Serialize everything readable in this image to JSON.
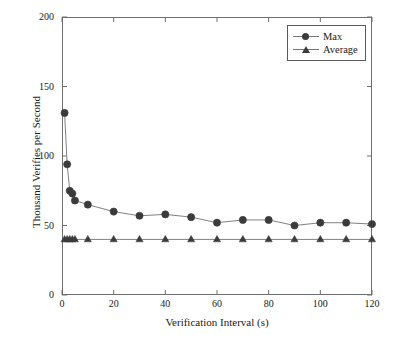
{
  "chart_data": {
    "type": "line",
    "title": "",
    "xlabel": "Verification Interval (s)",
    "ylabel": "Thousand Verifies per Second",
    "xlim": [
      0,
      120
    ],
    "ylim": [
      0,
      200
    ],
    "xticks": [
      "0",
      "20",
      "40",
      "60",
      "80",
      "100",
      "120"
    ],
    "xtick_values": [
      0,
      20,
      40,
      60,
      80,
      100,
      120
    ],
    "yticks": [
      "0",
      "50",
      "100",
      "150",
      "200"
    ],
    "ytick_values": [
      0,
      50,
      100,
      150,
      200
    ],
    "grid": false,
    "legend_position": "top-right",
    "series": [
      {
        "name": "Max",
        "marker": "circle",
        "color": "#3b3b3b",
        "x": [
          1,
          2,
          3,
          4,
          5,
          10,
          20,
          30,
          40,
          50,
          60,
          70,
          80,
          90,
          100,
          110,
          120
        ],
        "values": [
          131,
          94,
          75,
          73,
          68,
          65,
          60,
          57,
          58,
          56,
          52,
          54,
          54,
          50,
          52,
          52,
          51
        ]
      },
      {
        "name": "Average",
        "marker": "triangle",
        "color": "#3b3b3b",
        "x": [
          1,
          2,
          3,
          4,
          5,
          10,
          20,
          30,
          40,
          50,
          60,
          70,
          80,
          90,
          100,
          110,
          120
        ],
        "values": [
          40,
          40,
          40,
          40,
          40,
          40,
          40,
          40,
          40,
          40,
          40,
          40,
          40,
          40,
          40,
          40,
          40
        ]
      }
    ]
  },
  "legend": {
    "items": [
      {
        "label": "Max",
        "marker": "circle-marker-icon"
      },
      {
        "label": "Average",
        "marker": "triangle-marker-icon"
      }
    ]
  },
  "axes": {
    "x_title": "Verification Interval (s)",
    "y_title": "Thousand Verifies per Second"
  },
  "colors": {
    "series": "#3b3b3b",
    "line": "#808080",
    "frame": "#6e6e6e",
    "background": "#ffffff"
  }
}
